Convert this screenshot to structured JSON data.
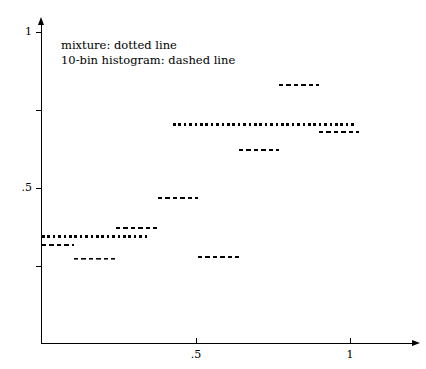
{
  "chart_data": {
    "type": "line",
    "title": "",
    "subtitle": "",
    "xlabel": "",
    "ylabel": "",
    "xlim": [
      0,
      1.2
    ],
    "ylim": [
      0,
      1.0
    ],
    "grid": false,
    "legend_position": "upper-left-inside",
    "x_ticks": [
      {
        "value": 0.5,
        "label": ".5"
      },
      {
        "value": 1.0,
        "label": "1"
      }
    ],
    "y_ticks": [
      {
        "value": 0.25,
        "label": ""
      },
      {
        "value": 0.5,
        "label": ".5"
      },
      {
        "value": 0.75,
        "label": ""
      },
      {
        "value": 1.0,
        "label": "1"
      }
    ],
    "annotations": [
      "mixture: dotted line",
      "10-bin histogram: dashed line"
    ],
    "series": [
      {
        "name": "mixture",
        "style": "dotted",
        "segments": [
          {
            "x0": -0.02,
            "x1": 0.345,
            "y": 0.346
          },
          {
            "x0": 0.425,
            "x1": 1.016,
            "y": 0.702
          }
        ]
      },
      {
        "name": "10-bin histogram",
        "style": "dashed",
        "segments": [
          {
            "x0": -0.02,
            "x1": 0.105,
            "y": 0.317
          },
          {
            "x0": 0.105,
            "x1": 0.24,
            "y": 0.273
          },
          {
            "x0": 0.24,
            "x1": 0.375,
            "y": 0.372
          },
          {
            "x0": 0.375,
            "x1": 0.505,
            "y": 0.468
          },
          {
            "x0": 0.505,
            "x1": 0.64,
            "y": 0.279
          },
          {
            "x0": 0.64,
            "x1": 0.77,
            "y": 0.622
          },
          {
            "x0": 0.77,
            "x1": 0.9,
            "y": 0.83
          },
          {
            "x0": 0.9,
            "x1": 1.03,
            "y": 0.679
          }
        ]
      }
    ],
    "colors": {
      "ink": "#000000",
      "background": "#ffffff"
    }
  },
  "axes": {
    "x_tick_labels": [
      ".5",
      "1"
    ],
    "y_tick_labels": [
      ".5",
      "1"
    ]
  },
  "legend": {
    "line1": "mixture: dotted line",
    "line2": "10-bin histogram: dashed line"
  }
}
